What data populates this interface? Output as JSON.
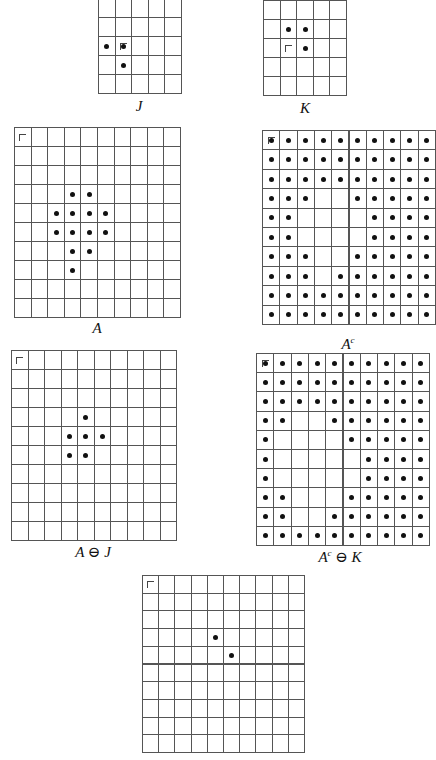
{
  "figure": {
    "panels": [
      {
        "id": "J",
        "caption": "J",
        "rows": 5,
        "cols": 5,
        "x": 98,
        "y": -2,
        "cell_w": 16.6,
        "cell_h": 19,
        "origin": [
          2,
          1
        ],
        "dots": [
          [
            2,
            0
          ],
          [
            2,
            1
          ],
          [
            3,
            1
          ]
        ],
        "caption_x": 139,
        "caption_y": 98
      },
      {
        "id": "K",
        "caption": "K",
        "rows": 5,
        "cols": 5,
        "x": 263,
        "y": 0,
        "cell_w": 16.6,
        "cell_h": 19,
        "origin": [
          2,
          1
        ],
        "dots": [
          [
            1,
            1
          ],
          [
            1,
            2
          ],
          [
            2,
            2
          ]
        ],
        "caption_x": 305,
        "caption_y": 100
      },
      {
        "id": "A",
        "caption": "A",
        "rows": 10,
        "cols": 10,
        "x": 14,
        "y": 127,
        "cell_w": 16.6,
        "cell_h": 19,
        "origin": [
          0,
          0
        ],
        "dots": [
          [
            3,
            3
          ],
          [
            3,
            4
          ],
          [
            4,
            2
          ],
          [
            4,
            3
          ],
          [
            4,
            4
          ],
          [
            4,
            5
          ],
          [
            5,
            2
          ],
          [
            5,
            3
          ],
          [
            5,
            4
          ],
          [
            5,
            5
          ],
          [
            6,
            3
          ],
          [
            6,
            4
          ],
          [
            7,
            3
          ]
        ],
        "caption_x": 97,
        "caption_y": 320
      },
      {
        "id": "Ac",
        "caption": "A",
        "caption_sup": "c",
        "rows": 10,
        "cols": 10,
        "x": 262,
        "y": 130,
        "cell_w": 17.3,
        "cell_h": 19.4,
        "origin": [
          0,
          0
        ],
        "dots_complement_of": [
          [
            3,
            3
          ],
          [
            3,
            4
          ],
          [
            4,
            2
          ],
          [
            4,
            3
          ],
          [
            4,
            4
          ],
          [
            4,
            5
          ],
          [
            5,
            2
          ],
          [
            5,
            3
          ],
          [
            5,
            4
          ],
          [
            5,
            5
          ],
          [
            6,
            3
          ],
          [
            6,
            4
          ],
          [
            7,
            3
          ]
        ],
        "caption_x": 348,
        "caption_y": 335
      },
      {
        "id": "AerodeJ",
        "caption": "A ⊖ J",
        "rows": 10,
        "cols": 10,
        "x": 11,
        "y": 350,
        "cell_w": 16.5,
        "cell_h": 19,
        "origin": [
          0,
          0
        ],
        "dots": [
          [
            3,
            4
          ],
          [
            4,
            3
          ],
          [
            4,
            4
          ],
          [
            4,
            5
          ],
          [
            5,
            3
          ],
          [
            5,
            4
          ]
        ],
        "caption_x": 93,
        "caption_y": 543
      },
      {
        "id": "AcerodeK",
        "caption": "A",
        "caption_sup": "c",
        "caption_suffix": " ⊖ K",
        "rows": 10,
        "cols": 10,
        "x": 256,
        "y": 353,
        "cell_w": 17.3,
        "cell_h": 19.2,
        "origin": [
          0,
          0
        ],
        "dots_complement_of": [
          [
            3,
            2
          ],
          [
            3,
            3
          ],
          [
            4,
            1
          ],
          [
            4,
            2
          ],
          [
            4,
            3
          ],
          [
            4,
            4
          ],
          [
            5,
            1
          ],
          [
            5,
            2
          ],
          [
            5,
            3
          ],
          [
            5,
            4
          ],
          [
            5,
            5
          ],
          [
            6,
            1
          ],
          [
            6,
            2
          ],
          [
            6,
            3
          ],
          [
            6,
            4
          ],
          [
            6,
            5
          ],
          [
            7,
            2
          ],
          [
            7,
            3
          ],
          [
            7,
            4
          ],
          [
            8,
            2
          ],
          [
            8,
            3
          ]
        ],
        "caption_x": 340,
        "caption_y": 548
      },
      {
        "id": "Result",
        "caption": "",
        "rows": 10,
        "cols": 10,
        "x": 142,
        "y": 575,
        "cell_w": 16.2,
        "cell_h": 17.7,
        "origin": [
          0,
          0
        ],
        "dots": [
          [
            3,
            4
          ],
          [
            4,
            5
          ]
        ],
        "caption_x": 223,
        "caption_y": 756
      }
    ]
  }
}
